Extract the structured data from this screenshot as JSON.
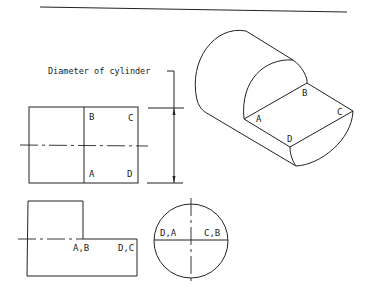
{
  "diagram": {
    "title_rule": true,
    "dimension": {
      "label": "Diameter of cylinder"
    },
    "front_view": {
      "labels": {
        "top_left": "B",
        "top_right": "C",
        "bottom_left": "A",
        "bottom_right": "D"
      }
    },
    "isometric_view": {
      "labels": {
        "a": "A",
        "b": "B",
        "c": "C",
        "d": "D"
      }
    },
    "top_view": {
      "labels": {
        "left": "A,B",
        "right": "D,C"
      }
    },
    "end_view": {
      "labels": {
        "left": "D,A",
        "right": "C,B"
      }
    },
    "colors": {
      "line": "#222222",
      "background": "#ffffff"
    }
  }
}
